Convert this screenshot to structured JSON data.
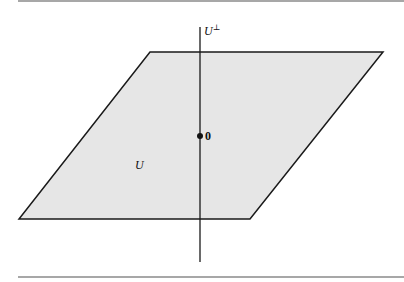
{
  "figure": {
    "plane_label": "U",
    "axis_label_base": "U",
    "axis_label_sup": "⊥",
    "origin_label": "0",
    "colors": {
      "plane_fill": "#e6e6e6",
      "stroke": "#1a1a1a",
      "rule": "#8a8a8a"
    }
  }
}
